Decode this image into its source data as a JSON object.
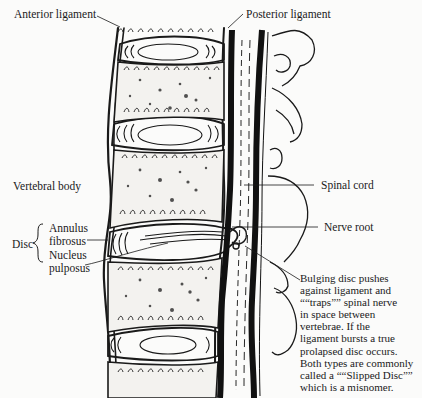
{
  "diagram": {
    "type": "anatomical illustration",
    "labels": {
      "anterior_ligament": "Anterior ligament",
      "posterior_ligament": "Posterior ligament",
      "vertebral_body": "Vertebral body",
      "spinal_cord": "Spinal cord",
      "nerve_root": "Nerve root",
      "disc": "Disc",
      "annulus_line1": "Annulus",
      "annulus_line2": "fibrosus",
      "nucleus_line1": "Nucleus",
      "nucleus_line2": "pulposus"
    },
    "note": {
      "lines": [
        "Bulging disc pushes",
        "against ligament and",
        "““traps”” spinal nerve",
        "in space between",
        "vertebrae. If the",
        "ligament bursts a true",
        "prolapsed disc occurs.",
        "Both types are commonly",
        "called a ““Slipped Disc””",
        "which is a misnomer."
      ]
    },
    "colors": {
      "ink": "#1a1a1a",
      "paper": "#fbfbfa"
    }
  }
}
